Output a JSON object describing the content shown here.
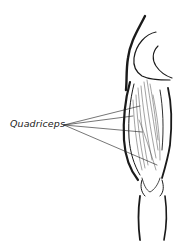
{
  "diagram": {
    "label": "Quadriceps",
    "leader_lines": 4,
    "colors": {
      "ink": "#1a1a1a",
      "background": "#ffffff"
    }
  }
}
